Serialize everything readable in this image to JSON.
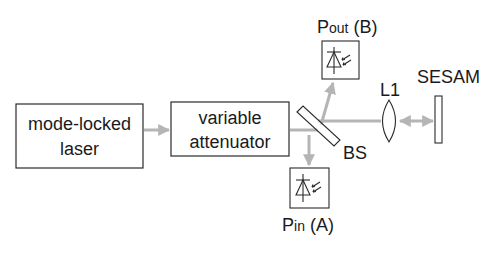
{
  "diagram": {
    "type": "optical-setup",
    "colors": {
      "beam": "#b5b5b5",
      "stroke": "#2a2a2a",
      "text": "#1a1a1a",
      "background": "#ffffff"
    },
    "blocks": [
      {
        "id": "laser",
        "line1": "mode-locked",
        "line2": "laser"
      },
      {
        "id": "attenuator",
        "line1": "variable",
        "line2": "attenuator"
      }
    ],
    "labels": {
      "pout_main": "P",
      "pout_sub": "out",
      "pout_suffix": " (B)",
      "pin_main": "P",
      "pin_sub": "in",
      "pin_suffix": " (A)",
      "bs": "BS",
      "lens": "L1",
      "sesam": "SESAM"
    },
    "components": [
      {
        "id": "beam-splitter",
        "label": "BS"
      },
      {
        "id": "photodiode-out",
        "label": "Pout (B)",
        "icon": "photodiode-icon"
      },
      {
        "id": "photodiode-in",
        "label": "Pin (A)",
        "icon": "photodiode-icon"
      },
      {
        "id": "lens",
        "label": "L1"
      },
      {
        "id": "sesam",
        "label": "SESAM"
      }
    ]
  }
}
